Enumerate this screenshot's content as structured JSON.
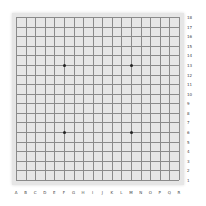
{
  "board": {
    "size": 18,
    "background_color": "#e6e6e6",
    "line_color": "#8a8a8a",
    "column_labels": [
      "A",
      "B",
      "C",
      "D",
      "E",
      "F",
      "G",
      "H",
      "I",
      "J",
      "K",
      "L",
      "M",
      "N",
      "O",
      "P",
      "Q",
      "R"
    ],
    "row_labels": [
      "18",
      "17",
      "16",
      "15",
      "14",
      "13",
      "12",
      "11",
      "10",
      "9",
      "8",
      "7",
      "6",
      "5",
      "4",
      "3",
      "2",
      "1"
    ],
    "star_points": [
      {
        "col": "F",
        "row": "13"
      },
      {
        "col": "M",
        "row": "13"
      },
      {
        "col": "F",
        "row": "6"
      },
      {
        "col": "M",
        "row": "6"
      }
    ],
    "stones": []
  }
}
